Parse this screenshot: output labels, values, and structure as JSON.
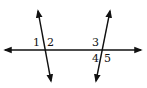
{
  "diagram": {
    "title": "",
    "stroke_color": "#111111",
    "angle_labels": [
      {
        "id": "1",
        "text": "1"
      },
      {
        "id": "2",
        "text": "2"
      },
      {
        "id": "3",
        "text": "3"
      },
      {
        "id": "4",
        "text": "4"
      },
      {
        "id": "5",
        "text": "5"
      }
    ]
  }
}
